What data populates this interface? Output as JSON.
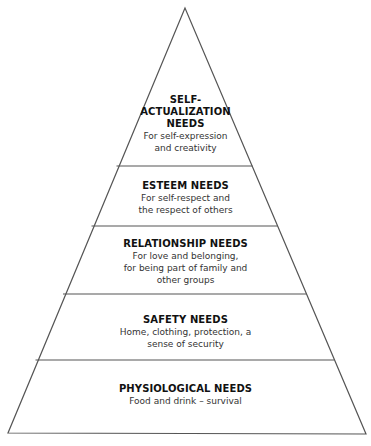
{
  "diagram": {
    "type": "pyramid",
    "line_color": "#555555",
    "tiers": [
      {
        "title_lines": [
          "SELF-",
          "ACTUALIZATION",
          "NEEDS"
        ],
        "desc_lines": [
          "For self-expression",
          "and creativity"
        ]
      },
      {
        "title_lines": [
          "ESTEEM NEEDS"
        ],
        "desc_lines": [
          "For self-respect and",
          "the respect of others"
        ]
      },
      {
        "title_lines": [
          "RELATIONSHIP NEEDS"
        ],
        "desc_lines": [
          "For love and belonging,",
          "for being part of family and",
          "other groups"
        ]
      },
      {
        "title_lines": [
          "SAFETY NEEDS"
        ],
        "desc_lines": [
          "Home, clothing, protection, a",
          "sense of security"
        ]
      },
      {
        "title_lines": [
          "PHYSIOLOGICAL NEEDS"
        ],
        "desc_lines": [
          "Food and drink – survival"
        ]
      }
    ]
  }
}
